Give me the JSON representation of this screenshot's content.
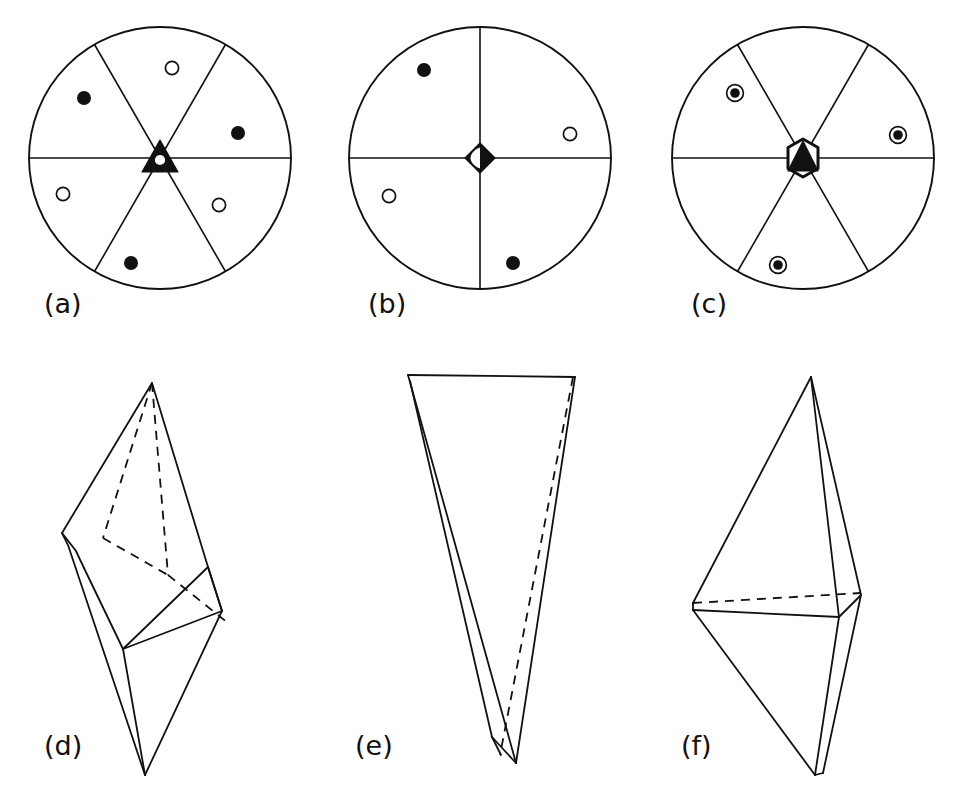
{
  "figure": {
    "background_color": "#ffffff",
    "line_color": "#111111",
    "width": 957,
    "height": 800
  },
  "panels": [
    {
      "id": "a",
      "label": "(a)",
      "kind": "stereogram",
      "center_symbol": "triangle-with-inversion-center",
      "center_symbol_name": "3-bar-inversion-axis-symbol",
      "sector_count": 6,
      "sector_line_angles_deg": [
        0,
        60,
        120
      ],
      "circle": {
        "cx": 160,
        "cy": 158,
        "r": 131
      },
      "markers": [
        {
          "type": "filled",
          "label": "filled-circle-upper-left",
          "cx": 84,
          "cy": 98,
          "r": 7
        },
        {
          "type": "open",
          "label": "open-circle-upper",
          "cx": 172,
          "cy": 68,
          "r": 7
        },
        {
          "type": "filled",
          "label": "filled-circle-right",
          "cx": 238,
          "cy": 133,
          "r": 7
        },
        {
          "type": "open",
          "label": "open-circle-lower-right",
          "cx": 219,
          "cy": 205,
          "r": 7
        },
        {
          "type": "filled",
          "label": "filled-circle-lower",
          "cx": 131,
          "cy": 263,
          "r": 7
        },
        {
          "type": "open",
          "label": "open-circle-left",
          "cx": 63,
          "cy": 194,
          "r": 7
        }
      ]
    },
    {
      "id": "b",
      "label": "(b)",
      "kind": "stereogram",
      "center_symbol": "lens-diamond-half-filled",
      "center_symbol_name": "4-bar-inversion-axis-symbol",
      "sector_count": 4,
      "sector_line_angles_deg": [
        0,
        90
      ],
      "circle": {
        "cx": 480,
        "cy": 158,
        "r": 131
      },
      "markers": [
        {
          "type": "filled",
          "label": "filled-circle-upper-left",
          "cx": 424,
          "cy": 70,
          "r": 7
        },
        {
          "type": "open",
          "label": "open-circle-right",
          "cx": 570,
          "cy": 134,
          "r": 7
        },
        {
          "type": "open",
          "label": "open-circle-lower-left",
          "cx": 389,
          "cy": 196,
          "r": 7
        },
        {
          "type": "filled",
          "label": "filled-circle-lower-right",
          "cx": 513,
          "cy": 263,
          "r": 7
        }
      ]
    },
    {
      "id": "c",
      "label": "(c)",
      "kind": "stereogram",
      "center_symbol": "hexagon-with-filled-triangle",
      "center_symbol_name": "6-bar-inversion-axis-symbol",
      "sector_count": 6,
      "sector_line_angles_deg": [
        0,
        60,
        120
      ],
      "circle": {
        "cx": 803,
        "cy": 158,
        "r": 131
      },
      "markers": [
        {
          "type": "ringed-filled",
          "label": "superimposed-pair-upper-left",
          "cx": 735,
          "cy": 93,
          "r": 8
        },
        {
          "type": "ringed-filled",
          "label": "superimposed-pair-right",
          "cx": 898,
          "cy": 135,
          "r": 8
        },
        {
          "type": "ringed-filled",
          "label": "superimposed-pair-lower",
          "cx": 778,
          "cy": 265,
          "r": 8
        }
      ]
    },
    {
      "id": "d",
      "label": "(d)",
      "kind": "polyhedron",
      "form_name": "rhombohedron",
      "description": "rhombohedron - the general form of the 3-bar inversion axis"
    },
    {
      "id": "e",
      "label": "(e)",
      "kind": "polyhedron",
      "form_name": "tetragonal-disphenoid",
      "description": "tetragonal disphenoid (tetrahedron) - the general form of the 4-bar inversion axis"
    },
    {
      "id": "f",
      "label": "(f)",
      "kind": "polyhedron",
      "form_name": "trigonal-bipyramid",
      "description": "trigonal bipyramid - the general form of the 6-bar inversion axis"
    }
  ],
  "labels": {
    "a": "(a)",
    "b": "(b)",
    "c": "(c)",
    "d": "(d)",
    "e": "(e)",
    "f": "(f)"
  }
}
